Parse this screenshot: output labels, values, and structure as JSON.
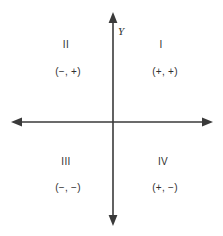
{
  "figure": {
    "kind": "cartesian-quadrant-diagram",
    "width": 223,
    "height": 236,
    "background_color": "#ffffff",
    "axis_color": "#3a3a3a",
    "text_color": "#2f2f2f"
  },
  "axes": {
    "vertical": {
      "name": "Y",
      "label": "Y",
      "x": 113,
      "y_top": 13,
      "y_bottom": 225,
      "arrow_top": true,
      "arrow_bottom": true
    },
    "horizontal": {
      "name": "X",
      "label": "",
      "y": 122,
      "x_left": 12,
      "x_right": 212,
      "arrow_left": true,
      "arrow_right": true
    },
    "origin": {
      "x": 113,
      "y": 122
    }
  },
  "quadrants": [
    {
      "id": "I",
      "numeral": "I",
      "signs": "(+, +)",
      "x_sign": "+",
      "y_sign": "+",
      "position": "top-right"
    },
    {
      "id": "II",
      "numeral": "II",
      "signs": "(−, +)",
      "x_sign": "−",
      "y_sign": "+",
      "position": "top-left"
    },
    {
      "id": "III",
      "numeral": "III",
      "signs": "(−, −)",
      "x_sign": "−",
      "y_sign": "−",
      "position": "bottom-left"
    },
    {
      "id": "IV",
      "numeral": "IV",
      "signs": "(+, −)",
      "x_sign": "+",
      "y_sign": "−",
      "position": "bottom-right"
    }
  ]
}
